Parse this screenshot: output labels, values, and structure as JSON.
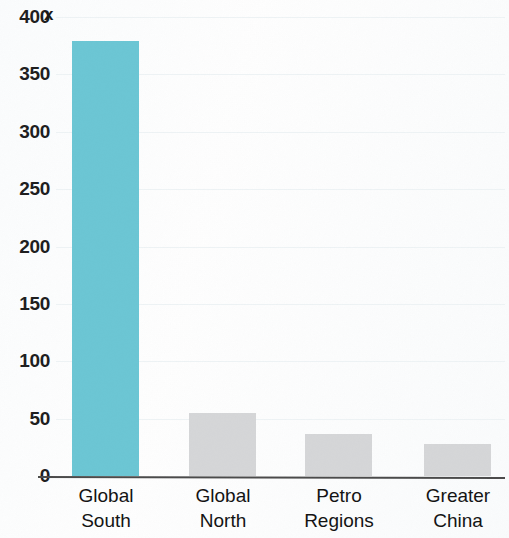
{
  "chart_data": {
    "type": "bar",
    "title": "",
    "subtitle": "",
    "xlabel": "",
    "ylabel": "",
    "categories": [
      "Global South",
      "Global North",
      "Petro Regions",
      "Greater China"
    ],
    "category_lines": [
      [
        "Global",
        "South"
      ],
      [
        "Global",
        "North"
      ],
      [
        "Petro",
        "Regions"
      ],
      [
        "Greater",
        "China"
      ]
    ],
    "values": [
      379,
      55,
      37,
      28
    ],
    "ylim": [
      0,
      400
    ],
    "yticks": [
      400,
      350,
      300,
      250,
      200,
      150,
      100,
      50,
      0
    ],
    "ytick_labels": [
      "400",
      "350",
      "300",
      "250",
      "200",
      "150",
      "100",
      "50",
      "0"
    ],
    "grid": true,
    "legend": "none",
    "bar_colors": [
      "#6bc6d4",
      "#d5d6d8",
      "#d5d6d8",
      "#d5d6d8"
    ],
    "annotations": [
      {
        "name": "axis-marker-x",
        "text": "x"
      }
    ]
  },
  "colors": {
    "highlight_bar": "#6bc6d4",
    "default_bar": "#d5d6d8",
    "axis_line": "#4a4a4a",
    "gridline": "#eef3f5",
    "text": "#121212",
    "background": "#fdfdfd"
  }
}
